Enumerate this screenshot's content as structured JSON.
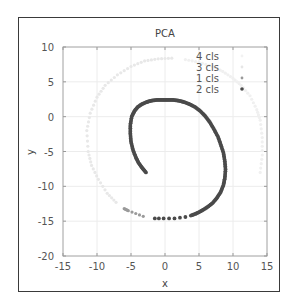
{
  "chart_data": {
    "type": "scatter",
    "title": "PCA",
    "xlabel": "x",
    "ylabel": "y",
    "xlim": [
      -15,
      15
    ],
    "ylim": [
      -20,
      10
    ],
    "xticks": [
      "-15",
      "-10",
      "-5",
      "0",
      "5",
      "10",
      "15"
    ],
    "yticks": [
      "10",
      "5",
      "0",
      "-5",
      "-10",
      "-15",
      "-20"
    ],
    "grid": true,
    "legend_position": "upper right",
    "legend": [
      {
        "label": "4 cls",
        "color": "#f2f2f2"
      },
      {
        "label": "3 cls",
        "color": "#e6e6e6"
      },
      {
        "label": "1 cls",
        "color": "#9a9a9a"
      },
      {
        "label": "2 cls",
        "color": "#4a4a4a"
      }
    ],
    "series": [
      {
        "name": "4 cls",
        "color": "#f0f0f0",
        "points": [
          [
            14.0,
            -8.0
          ],
          [
            14.3,
            -5.5
          ],
          [
            14.3,
            -3.0
          ],
          [
            14.0,
            -0.5
          ],
          [
            13.5,
            1.0
          ],
          [
            12.5,
            3.0
          ],
          [
            11.2,
            4.5
          ],
          [
            10.0,
            5.5
          ],
          [
            8.5,
            6.5
          ],
          [
            7.0,
            7.2
          ],
          [
            5.0,
            7.8
          ],
          [
            3.0,
            8.2
          ]
        ]
      },
      {
        "name": "3 cls",
        "color": "#e8e8e8",
        "points": [
          [
            1.0,
            8.4
          ],
          [
            -1.0,
            8.3
          ],
          [
            -3.0,
            8.0
          ],
          [
            -5.0,
            7.2
          ],
          [
            -7.0,
            6.0
          ],
          [
            -8.8,
            4.5
          ],
          [
            -10.0,
            2.8
          ],
          [
            -11.0,
            0.5
          ],
          [
            -11.5,
            -2.0
          ],
          [
            -11.3,
            -5.0
          ],
          [
            -10.8,
            -7.0
          ],
          [
            -9.8,
            -9.0
          ],
          [
            -8.5,
            -11.0
          ],
          [
            -7.2,
            -12.3
          ]
        ]
      },
      {
        "name": "1 cls",
        "color": "#9a9a9a",
        "points": [
          [
            -6.0,
            -13.2
          ],
          [
            -5.4,
            -13.5
          ],
          [
            -3.2,
            -14.3
          ]
        ]
      },
      {
        "name": "2 cls",
        "color": "#4a4a4a",
        "points": [
          [
            -2.8,
            -8.0
          ],
          [
            -3.4,
            -7.3
          ],
          [
            -3.9,
            -6.6
          ],
          [
            -4.3,
            -5.8
          ],
          [
            -4.7,
            -4.8
          ],
          [
            -5.0,
            -3.6
          ],
          [
            -5.1,
            -2.4
          ],
          [
            -5.1,
            -1.2
          ],
          [
            -4.9,
            0.0
          ],
          [
            -4.5,
            0.8
          ],
          [
            -4.0,
            1.4
          ],
          [
            -3.4,
            1.8
          ],
          [
            -2.7,
            2.1
          ],
          [
            -2.0,
            2.3
          ],
          [
            -1.2,
            2.4
          ],
          [
            -0.4,
            2.4
          ],
          [
            0.4,
            2.4
          ],
          [
            1.2,
            2.4
          ],
          [
            2.0,
            2.3
          ],
          [
            2.8,
            2.1
          ],
          [
            3.6,
            1.8
          ],
          [
            4.4,
            1.4
          ],
          [
            5.2,
            0.8
          ],
          [
            5.9,
            0.1
          ],
          [
            6.6,
            -0.8
          ],
          [
            7.2,
            -1.8
          ],
          [
            7.8,
            -2.9
          ],
          [
            8.2,
            -4.0
          ],
          [
            8.6,
            -5.2
          ],
          [
            8.8,
            -6.4
          ],
          [
            8.9,
            -7.6
          ],
          [
            8.8,
            -8.8
          ],
          [
            8.6,
            -9.8
          ],
          [
            8.2,
            -10.8
          ],
          [
            7.6,
            -11.7
          ],
          [
            7.0,
            -12.4
          ],
          [
            6.2,
            -13.0
          ],
          [
            5.4,
            -13.5
          ],
          [
            4.6,
            -13.9
          ],
          [
            3.8,
            -14.2
          ],
          [
            3.0,
            -14.4
          ],
          [
            2.2,
            -14.5
          ],
          [
            1.4,
            -14.6
          ],
          [
            0.6,
            -14.6
          ],
          [
            -0.2,
            -14.6
          ],
          [
            -0.9,
            -14.6
          ],
          [
            -1.5,
            -14.6
          ]
        ]
      }
    ]
  }
}
